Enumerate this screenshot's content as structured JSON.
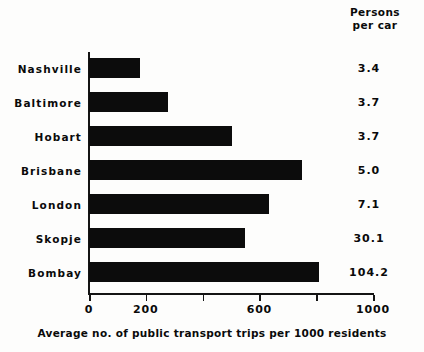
{
  "chart_data": {
    "type": "bar",
    "orientation": "horizontal",
    "title": "",
    "xlabel": "Average no. of public transport trips per 1000 residents",
    "ylabel": "",
    "xlim": [
      0,
      1000
    ],
    "grid": false,
    "legend": null,
    "categories": [
      "Nashville",
      "Baltimore",
      "Hobart",
      "Brisbane",
      "London",
      "Skopje",
      "Bombay"
    ],
    "values": [
      180,
      278,
      503,
      750,
      634,
      550,
      810
    ],
    "x_ticks": [
      0,
      200,
      400,
      600,
      800,
      1000
    ],
    "x_tick_labels": [
      "0",
      "200",
      "",
      "600",
      "",
      "1000"
    ],
    "annotation_column": {
      "header_line1": "Persons",
      "header_line2": "per car",
      "values": [
        "3.4",
        "3.7",
        "3.7",
        "5.0",
        "7.1",
        "30.1",
        "104.2"
      ]
    },
    "bar_color": "#0c0c0c",
    "axis_color": "#141414",
    "background_color": "#fdfdfc"
  },
  "header": {
    "line1": "Persons",
    "line2": "per car"
  },
  "rows": [
    {
      "label": "Nashville",
      "value": 180,
      "persons_per_car": "3.4"
    },
    {
      "label": "Baltimore",
      "value": 278,
      "persons_per_car": "3.7"
    },
    {
      "label": "Hobart",
      "value": 503,
      "persons_per_car": "3.7"
    },
    {
      "label": "Brisbane",
      "value": 750,
      "persons_per_car": "5.0"
    },
    {
      "label": "London",
      "value": 634,
      "persons_per_car": "7.1"
    },
    {
      "label": "Skopje",
      "value": 550,
      "persons_per_car": "30.1"
    },
    {
      "label": "Bombay",
      "value": 810,
      "persons_per_car": "104.2"
    }
  ],
  "axis": {
    "ticks": [
      {
        "value": 0,
        "label": "0"
      },
      {
        "value": 200,
        "label": "200"
      },
      {
        "value": 400,
        "label": ""
      },
      {
        "value": 600,
        "label": "600"
      },
      {
        "value": 800,
        "label": ""
      },
      {
        "value": 1000,
        "label": "1000"
      }
    ],
    "caption": "Average no. of public transport trips per 1000 residents"
  }
}
